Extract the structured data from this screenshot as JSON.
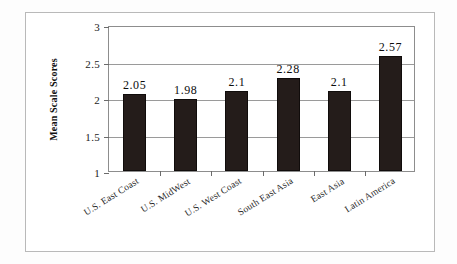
{
  "chart_data": {
    "type": "bar",
    "title": "",
    "xlabel": "",
    "ylabel": "Mean Scale Scores",
    "categories": [
      "U.S. East Coast",
      "U.S. MidWest",
      "U.S. West Coast",
      "South East Asia",
      "East Asia",
      "Latin America"
    ],
    "values": [
      2.05,
      1.98,
      2.1,
      2.28,
      2.1,
      2.57
    ],
    "value_labels": [
      "2.05",
      "1.98",
      "2.1",
      "2.28",
      "2.1",
      "2.57"
    ],
    "ylim": [
      1,
      3
    ],
    "ytick_labels": [
      "3",
      "2.5",
      "2",
      "1.5",
      "1"
    ],
    "ytick_values": [
      3,
      2.5,
      2,
      1.5,
      1
    ],
    "grid": true,
    "legend": "none",
    "bar_color": "#241c1a",
    "plot_background": "#ffffff",
    "gridline_color": "#9a9a9a",
    "frame_color": "#b9b9b9"
  }
}
